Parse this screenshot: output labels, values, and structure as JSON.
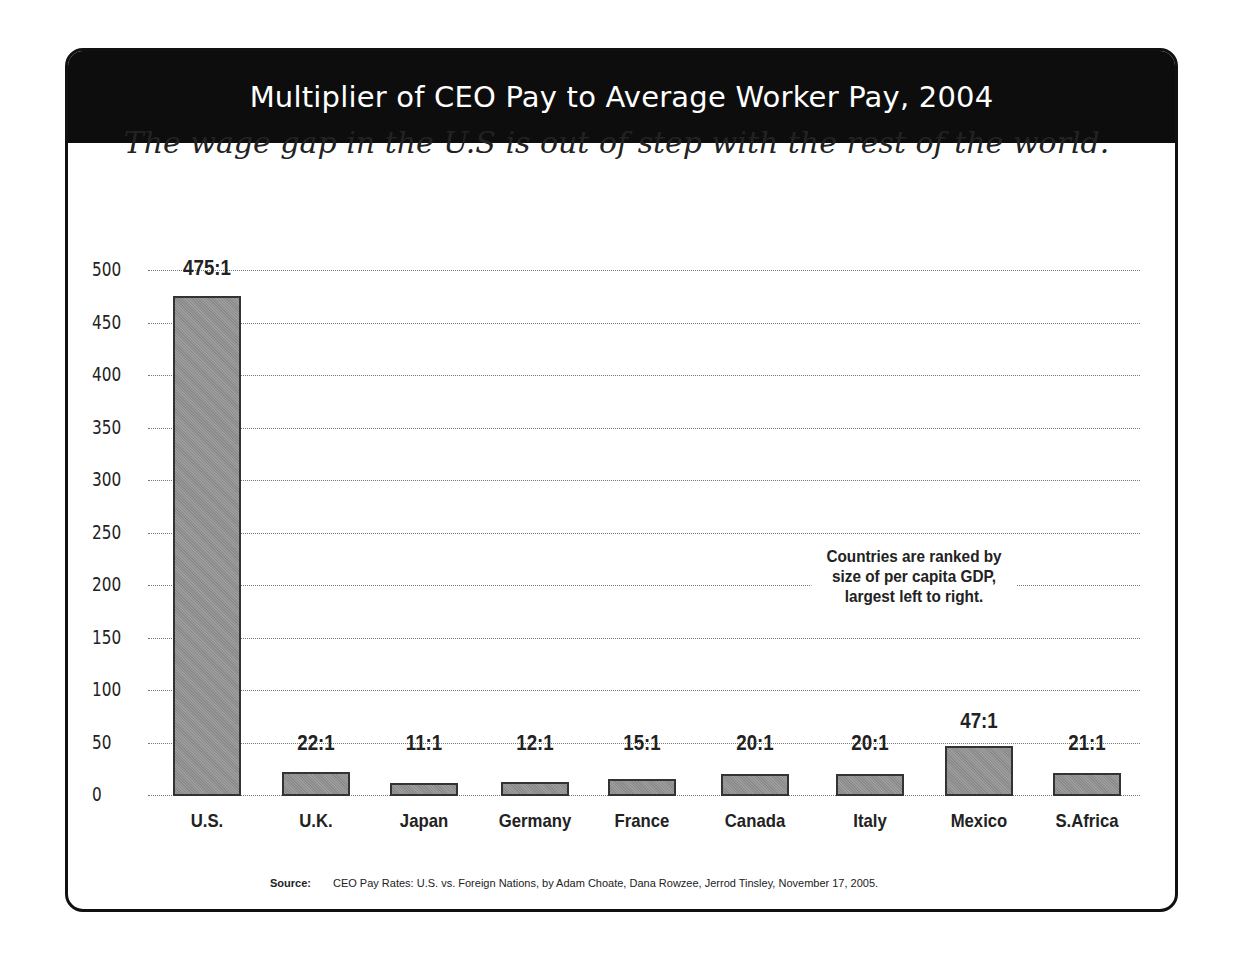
{
  "header": {
    "title": "Multiplier of CEO Pay to Average Worker Pay, 2004"
  },
  "subtitle": "The wage gap in the U.S is out of step with the rest of the world.",
  "note": "Countries are ranked by size of per capita GDP, largest left to right.",
  "source": {
    "label": "Source:",
    "text": "CEO Pay Rates: U.S. vs. Foreign Nations, by Adam Choate, Dana Rowzee, Jerrod Tinsley, November 17, 2005."
  },
  "colors": {
    "header_bg": "#0d0d0d",
    "bar_fill": "#939393",
    "bar_border": "#333333"
  },
  "chart_data": {
    "type": "bar",
    "title": "Multiplier of CEO Pay to Average Worker Pay, 2004",
    "subtitle": "The wage gap in the U.S is out of step with the rest of the world.",
    "xlabel": "",
    "ylabel": "",
    "ylim": [
      0,
      500
    ],
    "yticks": [
      0,
      50,
      100,
      150,
      200,
      250,
      300,
      350,
      400,
      450,
      500
    ],
    "grid": true,
    "categories": [
      "U.S.",
      "U.K.",
      "Japan",
      "Germany",
      "France",
      "Canada",
      "Italy",
      "Mexico",
      "S.Africa"
    ],
    "values": [
      475,
      22,
      11,
      12,
      15,
      20,
      20,
      47,
      21
    ],
    "data_labels": [
      "475:1",
      "22:1",
      "11:1",
      "12:1",
      "15:1",
      "20:1",
      "20:1",
      "47:1",
      "21:1"
    ],
    "annotations": [
      "Countries are ranked by size of per capita GDP, largest left to right."
    ],
    "legend": null
  }
}
